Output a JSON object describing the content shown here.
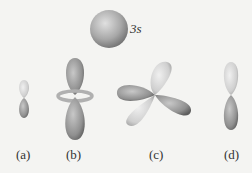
{
  "figure": {
    "top_orbital_label": "3s",
    "panels": [
      {
        "id": "a",
        "label": "(a)"
      },
      {
        "id": "b",
        "label": "(b)"
      },
      {
        "id": "c",
        "label": "(c)"
      },
      {
        "id": "d",
        "label": "(d)"
      }
    ],
    "colors": {
      "dark_lobe": "#8e8e8e",
      "light_lobe": "#cfcfcf",
      "background": "#f4f4f2"
    }
  }
}
